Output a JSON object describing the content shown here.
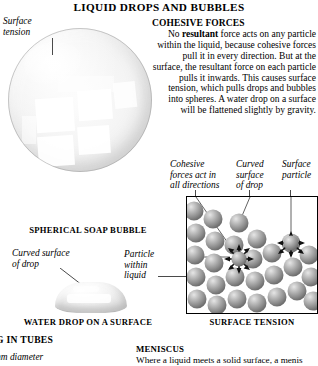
{
  "page": {
    "title": "LIQUID DROPS AND BUBBLES"
  },
  "bubble_figure": {
    "label_surface_tension": "Surface\ntension",
    "caption": "SPHERICAL SOAP BUBBLE"
  },
  "cohesive_forces": {
    "heading": "COHESIVE FORCES",
    "lead_plain": "No ",
    "lead_bold": "resultant",
    "body": " force acts on any particle within the liquid, because cohesive forces pull it in every direction. But at the surface, the resultant force on each particle pulls it inwards. This causes surface tension, which pulls drops and bubbles into spheres. A water drop on a surface will be flattened slightly by gravity."
  },
  "water_drop_figure": {
    "label_curved_surface": "Curved surface\nof drop",
    "label_particle_within": "Particle\nwithin\nliquid",
    "caption": "WATER DROP ON A SURFACE"
  },
  "surface_tension_panel": {
    "label_cohesive_forces": "Cohesive\nforces act in\nall directions",
    "label_curved_surface": "Curved\nsurface\nof drop",
    "label_surface_particle": "Surface\nparticle",
    "caption": "SURFACE TENSION",
    "particle_color": "#9a9a9a",
    "arrow_color": "#1a1a1a"
  },
  "bottom_section": {
    "heading_fragment": "G IN TUBES",
    "italic_fragment": "mm diameter",
    "meniscus_heading": "MENISCUS",
    "meniscus_body": "Where a liquid meets a solid surface, a menis"
  }
}
